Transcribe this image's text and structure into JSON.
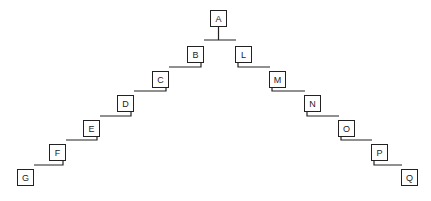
{
  "diagram": {
    "type": "tree",
    "root": "A",
    "nodes": [
      {
        "id": "A",
        "label": "A",
        "x": 210,
        "y": 10
      },
      {
        "id": "B",
        "label": "B",
        "x": 187,
        "y": 46
      },
      {
        "id": "C",
        "label": "C",
        "x": 152,
        "y": 71
      },
      {
        "id": "D",
        "label": "D",
        "x": 117,
        "y": 95
      },
      {
        "id": "E",
        "label": "E",
        "x": 83,
        "y": 120
      },
      {
        "id": "F",
        "label": "F",
        "x": 49,
        "y": 144
      },
      {
        "id": "G",
        "label": "G",
        "x": 17,
        "y": 169
      },
      {
        "id": "L",
        "label": "L",
        "x": 235,
        "y": 46
      },
      {
        "id": "M",
        "label": "M",
        "x": 269,
        "y": 71
      },
      {
        "id": "N",
        "label": "N",
        "x": 304,
        "y": 95
      },
      {
        "id": "O",
        "label": "O",
        "x": 338,
        "y": 120
      },
      {
        "id": "P",
        "label": "P",
        "x": 371,
        "y": 144
      },
      {
        "id": "Q",
        "label": "Q",
        "x": 401,
        "y": 169
      }
    ],
    "edges": [
      [
        "A",
        "B"
      ],
      [
        "A",
        "L"
      ],
      [
        "B",
        "C"
      ],
      [
        "C",
        "D"
      ],
      [
        "D",
        "E"
      ],
      [
        "E",
        "F"
      ],
      [
        "F",
        "G"
      ],
      [
        "L",
        "M"
      ],
      [
        "M",
        "N"
      ],
      [
        "N",
        "O"
      ],
      [
        "O",
        "P"
      ],
      [
        "P",
        "Q"
      ]
    ]
  }
}
